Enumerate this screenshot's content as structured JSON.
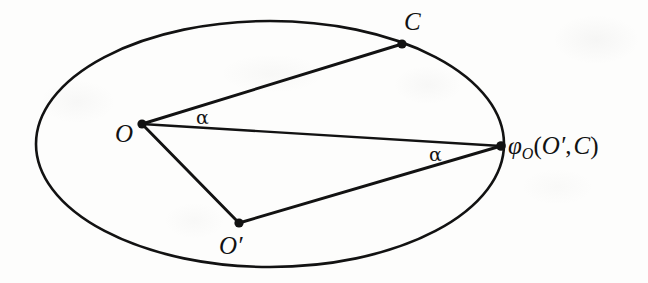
{
  "figure": {
    "type": "geometric-diagram",
    "ink_color": "#121212",
    "paper_color": "#fdfdfc"
  },
  "ellipse": {
    "name": "boundary-ellipse",
    "cx": 270,
    "cy": 144,
    "rx": 234,
    "ry": 123,
    "stroke_width": 2.6
  },
  "points": [
    {
      "id": "O",
      "label": "O",
      "x": 142,
      "y": 124,
      "label_x": 115,
      "label_y": 121
    },
    {
      "id": "C",
      "label": "C",
      "x": 402,
      "y": 44,
      "label_x": 404,
      "label_y": 9
    },
    {
      "id": "Op",
      "label": "O′",
      "x": 239,
      "y": 223,
      "label_x": 219,
      "label_y": 233
    },
    {
      "id": "phi",
      "label": "",
      "x": 501,
      "y": 146,
      "label_x": 508,
      "label_y": 133
    }
  ],
  "segments": [
    {
      "name": "segment-O-to-C",
      "from": "O",
      "to": "C"
    },
    {
      "name": "segment-O-to-phi",
      "from": "O",
      "to": "phi"
    },
    {
      "name": "segment-O-to-Op",
      "from": "O",
      "to": "Op"
    },
    {
      "name": "segment-Op-to-phi",
      "from": "Op",
      "to": "phi"
    }
  ],
  "labels": {
    "point_O": "O",
    "point_C": "C",
    "point_O_prime": "O′",
    "phi_symbol": "φ",
    "phi_subscript": "O",
    "phi_open_paren": "(",
    "phi_arg_first": "O′",
    "phi_comma": ",",
    "phi_arg_second": "C",
    "phi_close_paren": ")",
    "phi_full": "φO(O′, C)",
    "angle_alpha_upper": "α",
    "angle_alpha_lower": "α"
  }
}
